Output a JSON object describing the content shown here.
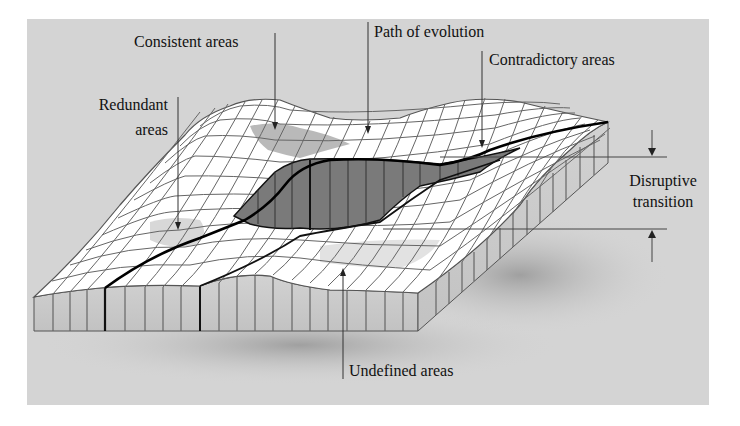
{
  "figure": {
    "type": "3d-landscape-diagram",
    "background_color": "#d4d4d4",
    "surface_color": "#ffffff",
    "grid_line_color": "#555555",
    "slab_side_color": "#c9c9c9",
    "path_color": "#000000",
    "contradictory_fill": "#7a7a7a",
    "consistent_fill": "#a8a8a8",
    "redundant_fill": "#d8d8d8"
  },
  "labels": {
    "consistent_areas": "Consistent areas",
    "path_of_evolution": "Path of evolution",
    "contradictory_areas": "Contradictory areas",
    "redundant_areas_line1": "Redundant",
    "redundant_areas_line2": "areas",
    "disruptive_transition_line1": "Disruptive",
    "disruptive_transition_line2": "transition",
    "undefined_areas": "Undefined areas"
  }
}
